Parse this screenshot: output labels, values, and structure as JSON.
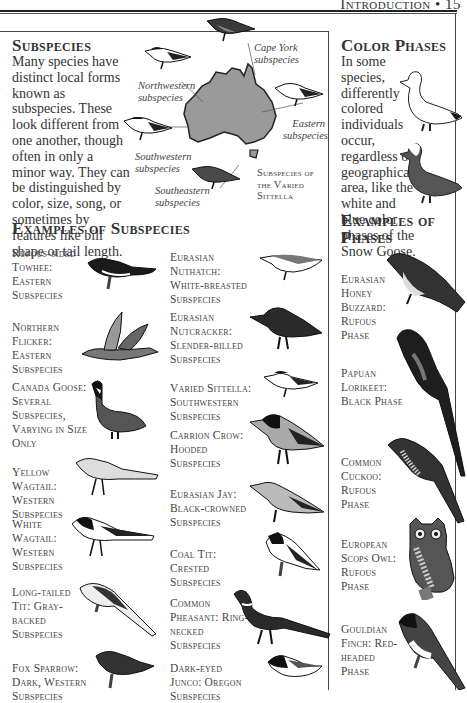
{
  "running_head": "Introduction • 15",
  "subspecies": {
    "title": "Subspecies",
    "body": "Many species have distinct local forms known as subspecies. These look different from one another, though often in only a minor way. They can be distinguished by color, size, song, or sometimes by features like bill shape or tail length.",
    "map": {
      "caption": "Subspecies of the Varied Sittella",
      "labels": {
        "cape_york": "Cape York subspecies",
        "northwestern": "Northwestern subspecies",
        "eastern": "Eastern subspecies",
        "southwestern": "Southwestern subspecies",
        "southeastern": "Southeastern subspecies"
      }
    }
  },
  "color_phases": {
    "title": "Color Phases",
    "body": "In some species, differently colored individuals occur, regardless of geographical area, like the white and blue color phases of the Snow Goose."
  },
  "examples_subspecies": {
    "title": "Examples of Subspecies",
    "left": [
      {
        "caption": "Rufous-sided Towhee: Eastern Subspecies"
      },
      {
        "caption": "Northern Flicker: Eastern Subspecies"
      },
      {
        "caption": "Canada Goose: Several Subspecies, Varying in Size Only"
      },
      {
        "caption": "Yellow Wagtail: Western Subspecies"
      },
      {
        "caption": "White Wagtail: Western Subspecies"
      },
      {
        "caption": "Long-tailed Tit: Gray-backed Subspecies"
      },
      {
        "caption": "Fox Sparrow: Dark, Western Subspecies"
      }
    ],
    "right": [
      {
        "caption": "Eurasian Nuthatch: White-breasted Subspecies"
      },
      {
        "caption": "Eurasian Nutcracker: Slender-billed Subspecies"
      },
      {
        "caption": "Varied Sittella: Southwestern Subspecies"
      },
      {
        "caption": "Carrion Crow: Hooded Subspecies"
      },
      {
        "caption": "Eurasian Jay: Black-crowned Subspecies"
      },
      {
        "caption": "Coal Tit: Crested Subspecies"
      },
      {
        "caption": "Common Pheasant: Ring-necked Subspecies"
      },
      {
        "caption": "Dark-eyed Junco: Oregon Subspecies"
      }
    ]
  },
  "examples_phases": {
    "title": "Examples of Phases",
    "items": [
      {
        "caption": "Eurasian Honey Buzzard: Rufous Phase"
      },
      {
        "caption": "Papuan Lorikeet: Black Phase"
      },
      {
        "caption": "Common Cuckoo: Rufous Phase"
      },
      {
        "caption": "European Scops Owl: Rufous Phase"
      },
      {
        "caption": "Gouldian Finch: Red-headed Phase"
      }
    ]
  },
  "colors": {
    "map_fill": "#9a9a9a",
    "ink": "#222222",
    "text": "#333333"
  }
}
